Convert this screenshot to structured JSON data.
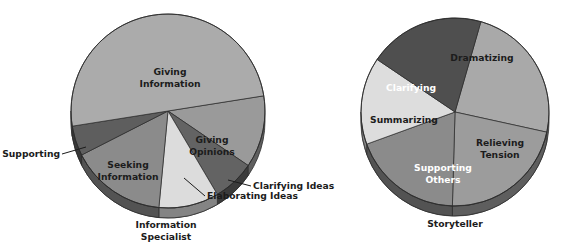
{
  "figure": {
    "background_color": "#ffffff",
    "label_color": "#1c1c1c",
    "outline_color": "#2b2b2b"
  },
  "chart_data": [
    {
      "type": "pie",
      "title": "Information Specialist",
      "caption": "Information Specialist",
      "center": [
        168,
        111
      ],
      "radius": 97,
      "depth": 10,
      "start_angle_deg": -9,
      "categories": [
        "Giving Opinions",
        "Clarifying Ideas",
        "Elaborating Ideas",
        "Seeking Information",
        "Supporting",
        "Giving Information"
      ],
      "values": [
        12,
        7,
        10,
        16,
        5,
        50
      ],
      "colors": [
        "#9a9a9a",
        "#636363",
        "#dcdcdc",
        "#8b8b8b",
        "#5e5e5e",
        "#ababab"
      ],
      "label_placement": [
        "inside",
        "callout",
        "callout",
        "inside",
        "callout",
        "inside"
      ],
      "labels": [
        {
          "text": "Giving\nOpinions",
          "lines": [
            "Giving",
            "Opinions"
          ],
          "x": 212,
          "y": 140
        },
        {
          "text": "Clarifying Ideas",
          "lines": [
            "Clarifying Ideas"
          ],
          "x": 253,
          "y": 186
        },
        {
          "text": "Elaborating Ideas",
          "lines": [
            "Elaborating Ideas"
          ],
          "x": 206,
          "y": 203
        },
        {
          "text": "Seeking\nInformation",
          "lines": [
            "Seeking",
            "Information"
          ],
          "x": 128,
          "y": 165
        },
        {
          "text": "Supporting",
          "lines": [
            "Supporting"
          ],
          "x": 8,
          "y": 154
        },
        {
          "text": "Giving\nInformation",
          "lines": [
            "Giving",
            "Information"
          ],
          "x": 170,
          "y": 72
        }
      ],
      "ylabel": "",
      "xlabel": "",
      "legend": "none",
      "grid": false
    },
    {
      "type": "pie",
      "title": "Storyteller",
      "caption": "Storyteller",
      "center": [
        455,
        112
      ],
      "radius": 94,
      "depth": 10,
      "start_angle_deg": -74,
      "categories": [
        "Dramatizing",
        "Relieving Tension",
        "Supporting Others",
        "Summarizing",
        "Clarifying"
      ],
      "values": [
        24,
        22,
        19,
        15,
        20
      ],
      "colors": [
        "#a9a9a9",
        "#9c9c9c",
        "#8b8b8b",
        "#dddddd",
        "#4f4f4f"
      ],
      "label_placement": [
        "inside",
        "inside",
        "inside",
        "inside",
        "inside"
      ],
      "labels": [
        {
          "text": "Dramatizing",
          "lines": [
            "Dramatizing"
          ],
          "x": 482,
          "y": 58,
          "light": false
        },
        {
          "text": "Relieving\nTension",
          "lines": [
            "Relieving",
            "Tension"
          ],
          "x": 500,
          "y": 143,
          "light": false
        },
        {
          "text": "Supporting\nOthers",
          "lines": [
            "Supporting",
            "Others"
          ],
          "x": 443,
          "y": 168,
          "light": true
        },
        {
          "text": "Summarizing",
          "lines": [
            "Summarizing"
          ],
          "x": 404,
          "y": 120,
          "light": false
        },
        {
          "text": "Clarifying",
          "lines": [
            "Clarifying"
          ],
          "x": 411,
          "y": 88,
          "light": true
        }
      ],
      "ylabel": "",
      "xlabel": "",
      "legend": "none",
      "grid": false
    }
  ],
  "callouts": [
    {
      "name": "supporting",
      "label": "Supporting",
      "from": [
        62,
        154
      ],
      "to": [
        86,
        147
      ]
    },
    {
      "name": "clarifying-ideas",
      "label": "Clarifying Ideas",
      "from": [
        251,
        186
      ],
      "to": [
        228,
        180
      ]
    },
    {
      "name": "elaborating-ideas",
      "label": "Elaborating Ideas",
      "from": [
        205,
        196
      ],
      "to": [
        184,
        178
      ]
    }
  ],
  "captions": [
    {
      "name": "information-specialist",
      "lines": [
        "Information",
        "Specialist"
      ],
      "x": 166,
      "y": 225
    },
    {
      "name": "storyteller",
      "lines": [
        "Storyteller"
      ],
      "x": 455,
      "y": 224
    }
  ]
}
